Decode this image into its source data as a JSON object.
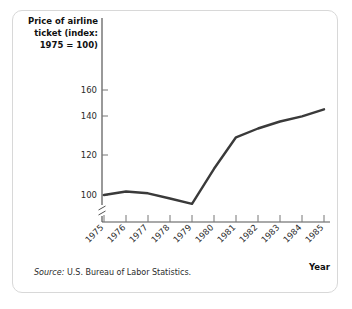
{
  "figure": {
    "y_axis_title_lines": [
      "Price of airline",
      "ticket (index:",
      "1975 = 100)"
    ],
    "x_axis_name": "Year",
    "source_label": "Source:",
    "source_text": "U.S. Bureau of Labor Statistics.",
    "line_color": "#3a3a3a",
    "axis_color": "#555555",
    "card_border_color": "#d8d8d8"
  },
  "chart_data": {
    "type": "line",
    "title": "Price of airline ticket (index: 1975 = 100)",
    "xlabel": "Year",
    "ylabel": "Price of airline ticket (index: 1975 = 100)",
    "categories": [
      "1975",
      "1976",
      "1977",
      "1978",
      "1979",
      "1980",
      "1981",
      "1982",
      "1983",
      "1984",
      "1985"
    ],
    "values": [
      100,
      102,
      101,
      98,
      95,
      115,
      133,
      138,
      142,
      145,
      149
    ],
    "yticks": [
      100,
      120,
      140,
      160
    ],
    "ylim": [
      92,
      168
    ],
    "axis_break": true,
    "grid": false,
    "legend": false,
    "series": [
      {
        "name": "Price of airline ticket",
        "values": [
          100,
          102,
          101,
          98,
          95,
          115,
          133,
          138,
          142,
          145,
          149
        ]
      }
    ]
  }
}
